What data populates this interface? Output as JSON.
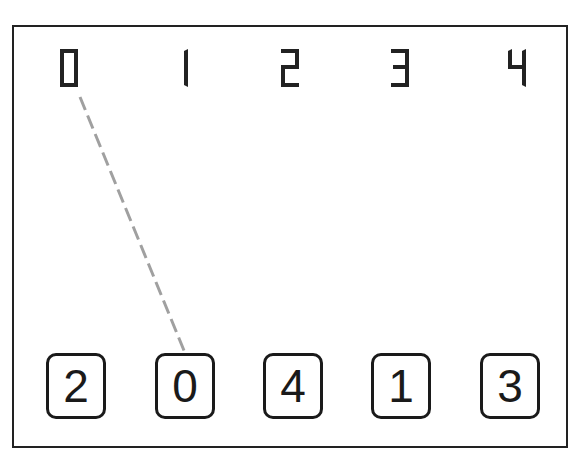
{
  "game": {
    "top_labels": [
      "0",
      "1",
      "2",
      "3",
      "4"
    ],
    "cards": [
      "2",
      "0",
      "4",
      "1",
      "3"
    ],
    "connection": {
      "from_label": "0",
      "to_card_index": 1,
      "color": "#a0a0a0"
    }
  }
}
